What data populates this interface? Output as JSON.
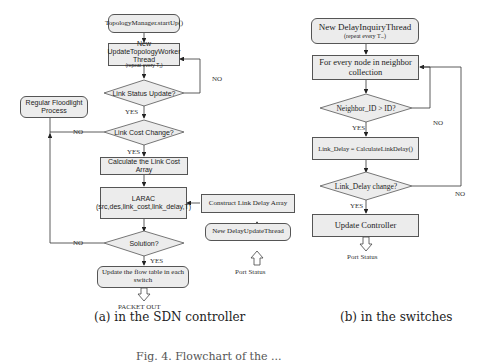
{
  "figure": {
    "caption_partial": "Fig. 4. Flowchart of the ... "
  },
  "panel_a": {
    "caption": "(a) in the SDN controller",
    "nodes": {
      "start": "TopologyManager.startUp()",
      "worker_title": "New UpdateTopologyWorker Thread",
      "worker_sub": "(repeat every T₁)",
      "link_status": "Link Status Update?",
      "link_cost_change": "Link Cost Change?",
      "calc_cost": "Calculate the Link Cost Array",
      "larac_title": "LARAC",
      "larac_args": "(src,des,link_cost,link_delay,T)",
      "solution": "Solution?",
      "update_flow": "Update the flow table in each switch",
      "regular": "Regular Floodlight Process",
      "construct_delay": "Construct Link Delay Array",
      "delay_update_thread": "New DelayUpdateThread"
    },
    "labels": {
      "no1": "NO",
      "yes1": "YES",
      "no2": "NO",
      "yes2": "YES",
      "no3": "NO",
      "yes3": "YES",
      "packet_out": "PACKET OUT",
      "port_status": "Port Status"
    }
  },
  "panel_b": {
    "caption": "(b) in the switches",
    "nodes": {
      "inquiry_title": "New DelayInquiryThread",
      "inquiry_sub": "(repeat every Tₓₑ)",
      "for_every": "For every node in neighbor collection",
      "neighbor_check": "Neighbor_ID > ID?",
      "calc_delay": "Link_Delay = CalculateLinkDelay()",
      "delay_change": "Link_Delay change?",
      "update_controller": "Update Controller"
    },
    "labels": {
      "no1": "NO",
      "yes1": "YES",
      "no2": "NO",
      "yes2": "YES",
      "port_status": "Port Status"
    }
  }
}
